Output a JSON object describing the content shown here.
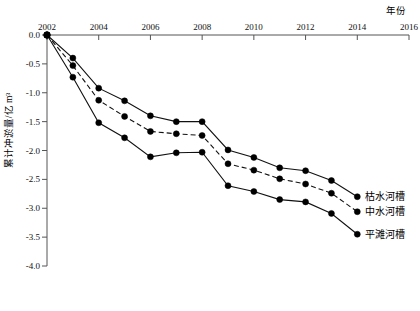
{
  "chart_data": {
    "type": "line",
    "title": "",
    "xlabel": "年份",
    "ylabel": "累计冲淤量/亿 m³",
    "x": [
      2002,
      2003,
      2004,
      2005,
      2006,
      2007,
      2008,
      2009,
      2010,
      2011,
      2012,
      2013,
      2014
    ],
    "xlim": [
      2002,
      2016
    ],
    "ylim": [
      -4.0,
      0.0
    ],
    "xticks": [
      2002,
      2004,
      2006,
      2008,
      2010,
      2012,
      2014,
      2016
    ],
    "xtick_labels": [
      "2002",
      "2004",
      "2006",
      "2008",
      "2010",
      "2012",
      "2014",
      "2016"
    ],
    "yticks": [
      0.0,
      -0.5,
      -1.0,
      -1.5,
      -2.0,
      -2.5,
      -3.0,
      -3.5,
      -4.0
    ],
    "ytick_labels": [
      "0.0",
      "-0.5",
      "-1.0",
      "-1.5",
      "-2.0",
      "-2.5",
      "-3.0",
      "-3.5",
      "-4.0"
    ],
    "grid": false,
    "legend_position": "right-end-labels",
    "x_axis_position": "top",
    "series": [
      {
        "name": "枯水河槽",
        "style": "solid",
        "marker": "filled-circle",
        "label_at_end": "枯水河槽",
        "values": [
          0.0,
          -0.4,
          -0.92,
          -1.14,
          -1.4,
          -1.5,
          -1.5,
          -1.99,
          -2.12,
          -2.3,
          -2.35,
          -2.52,
          -2.8
        ]
      },
      {
        "name": "中水河槽",
        "style": "dashed",
        "marker": "filled-circle",
        "label_at_end": "中水河槽",
        "values": [
          0.0,
          -0.53,
          -1.13,
          -1.41,
          -1.67,
          -1.71,
          -1.74,
          -2.23,
          -2.34,
          -2.49,
          -2.58,
          -2.74,
          -3.06
        ]
      },
      {
        "name": "平滩河槽",
        "style": "solid",
        "marker": "filled-circle",
        "label_at_end": "平滩河槽",
        "values": [
          0.0,
          -0.73,
          -1.52,
          -1.78,
          -2.11,
          -2.04,
          -2.03,
          -2.61,
          -2.71,
          -2.85,
          -2.89,
          -3.09,
          -3.45
        ]
      }
    ]
  },
  "axes": {
    "x_axis_title": "年份",
    "y_axis_title": "累计冲淤量/亿 m³"
  },
  "colors": {
    "line": "#111111",
    "axis": "#555555",
    "marker": "#000000",
    "background": "#ffffff"
  }
}
